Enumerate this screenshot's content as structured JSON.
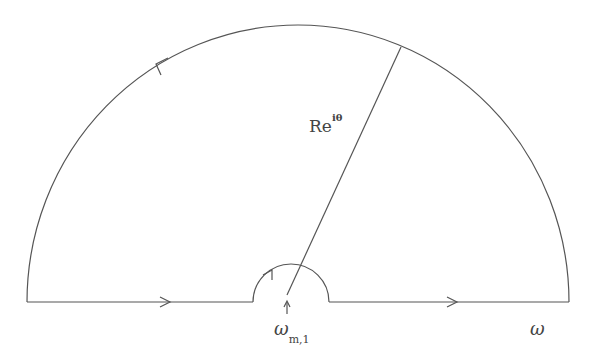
{
  "diagram": {
    "type": "contour-integration",
    "labels": {
      "radius_base": "Re",
      "radius_exponent": "iθ",
      "axis_variable": "ω",
      "pole_symbol": "ω",
      "pole_subscript": "m,1"
    },
    "geometry": {
      "baseline_y": 302,
      "left_x": 27,
      "right_x": 569,
      "outer_center_x": 298,
      "outer_radius": 271,
      "indent_left_x": 253,
      "indent_right_x": 329,
      "indent_radius": 38,
      "radial_line": {
        "x1": 287,
        "y1": 295,
        "x2": 401,
        "y2": 47
      }
    },
    "arrows": [
      {
        "name": "arrow-left-segment",
        "x": 168,
        "y": 302,
        "direction": "right"
      },
      {
        "name": "arrow-right-segment",
        "x": 455,
        "y": 302,
        "direction": "right"
      },
      {
        "name": "arrow-outer-arc",
        "x": 157,
        "y": 63,
        "direction": "counter-clockwise"
      },
      {
        "name": "arrow-indent-arc",
        "x": 271,
        "y": 273,
        "direction": "clockwise"
      }
    ],
    "colors": {
      "stroke": "#555555",
      "background": "#ffffff"
    }
  }
}
